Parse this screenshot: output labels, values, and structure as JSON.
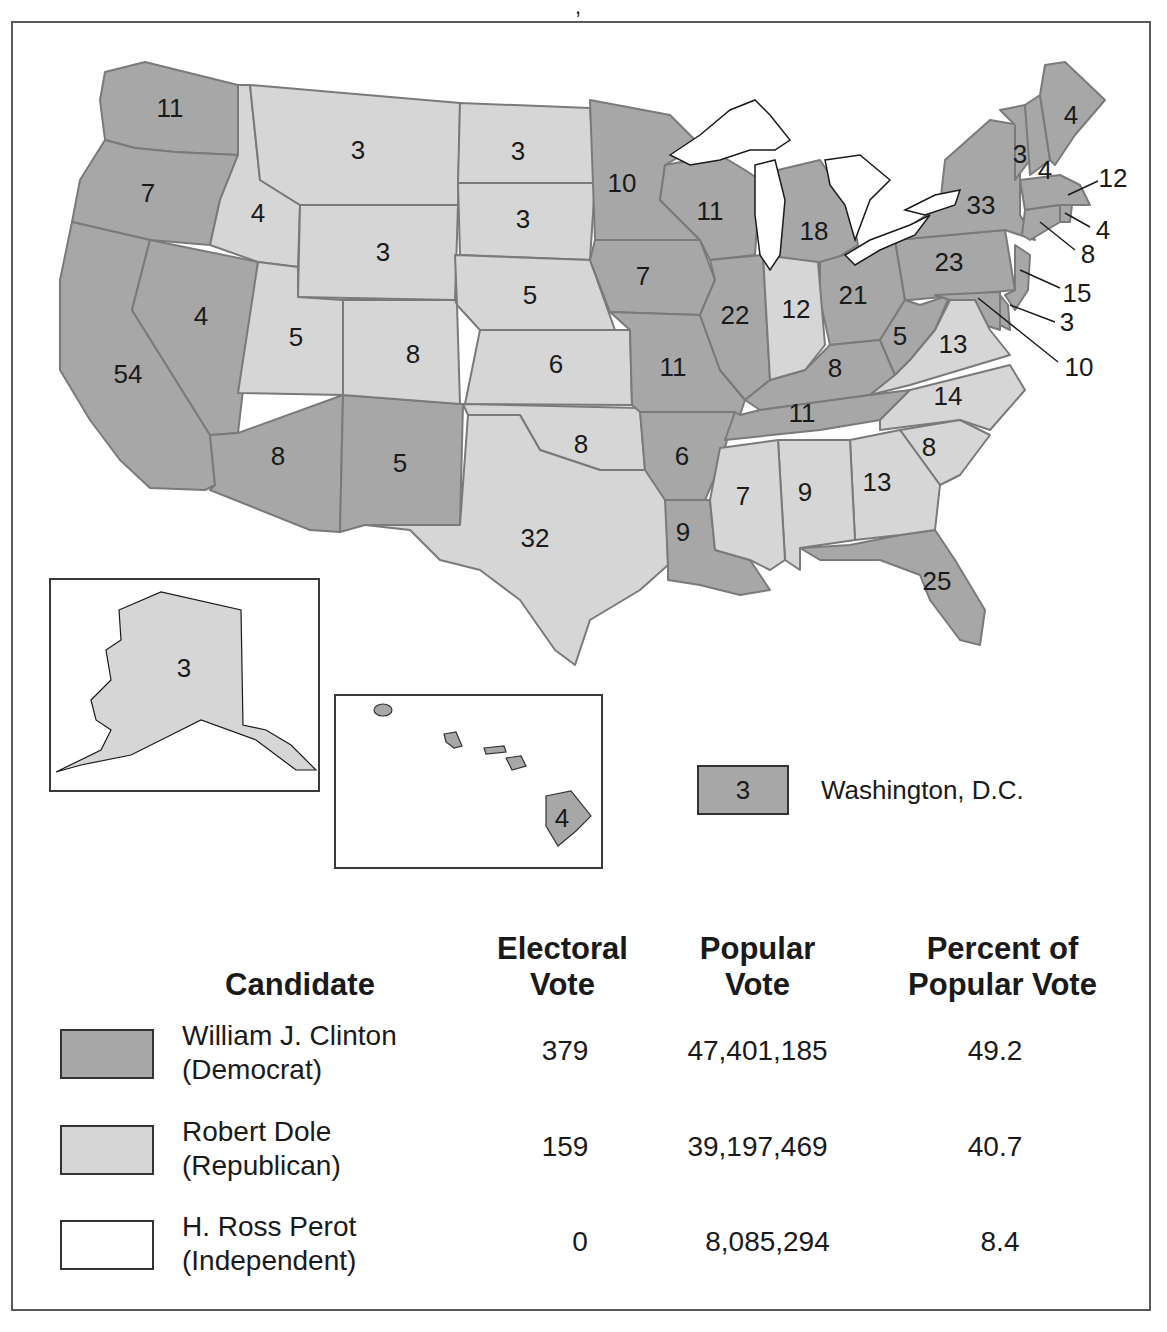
{
  "colors": {
    "democrat": "#a7a7a7",
    "republican": "#d6d6d6",
    "independent": "#ffffff",
    "border": "#7a7a7a",
    "frame": "#5a5a5a"
  },
  "map": {
    "states": [
      {
        "abbr": "WA",
        "votes": "11",
        "party": "democrat"
      },
      {
        "abbr": "OR",
        "votes": "7",
        "party": "democrat"
      },
      {
        "abbr": "CA",
        "votes": "54",
        "party": "democrat"
      },
      {
        "abbr": "NV",
        "votes": "4",
        "party": "democrat"
      },
      {
        "abbr": "ID",
        "votes": "4",
        "party": "republican"
      },
      {
        "abbr": "MT",
        "votes": "3",
        "party": "republican"
      },
      {
        "abbr": "WY",
        "votes": "3",
        "party": "republican"
      },
      {
        "abbr": "UT",
        "votes": "5",
        "party": "republican"
      },
      {
        "abbr": "AZ",
        "votes": "8",
        "party": "democrat"
      },
      {
        "abbr": "CO",
        "votes": "8",
        "party": "republican"
      },
      {
        "abbr": "NM",
        "votes": "5",
        "party": "democrat"
      },
      {
        "abbr": "ND",
        "votes": "3",
        "party": "republican"
      },
      {
        "abbr": "SD",
        "votes": "3",
        "party": "republican"
      },
      {
        "abbr": "NE",
        "votes": "5",
        "party": "republican"
      },
      {
        "abbr": "KS",
        "votes": "6",
        "party": "republican"
      },
      {
        "abbr": "OK",
        "votes": "8",
        "party": "republican"
      },
      {
        "abbr": "TX",
        "votes": "32",
        "party": "republican"
      },
      {
        "abbr": "MN",
        "votes": "10",
        "party": "democrat"
      },
      {
        "abbr": "IA",
        "votes": "7",
        "party": "democrat"
      },
      {
        "abbr": "MO",
        "votes": "11",
        "party": "democrat"
      },
      {
        "abbr": "AR",
        "votes": "6",
        "party": "democrat"
      },
      {
        "abbr": "LA",
        "votes": "9",
        "party": "democrat"
      },
      {
        "abbr": "WI",
        "votes": "11",
        "party": "democrat"
      },
      {
        "abbr": "IL",
        "votes": "22",
        "party": "democrat"
      },
      {
        "abbr": "MI",
        "votes": "18",
        "party": "democrat"
      },
      {
        "abbr": "IN",
        "votes": "12",
        "party": "republican"
      },
      {
        "abbr": "OH",
        "votes": "21",
        "party": "democrat"
      },
      {
        "abbr": "KY",
        "votes": "8",
        "party": "democrat"
      },
      {
        "abbr": "TN",
        "votes": "11",
        "party": "democrat"
      },
      {
        "abbr": "MS",
        "votes": "7",
        "party": "republican"
      },
      {
        "abbr": "AL",
        "votes": "9",
        "party": "republican"
      },
      {
        "abbr": "GA",
        "votes": "13",
        "party": "republican"
      },
      {
        "abbr": "FL",
        "votes": "25",
        "party": "democrat"
      },
      {
        "abbr": "SC",
        "votes": "8",
        "party": "republican"
      },
      {
        "abbr": "NC",
        "votes": "14",
        "party": "republican"
      },
      {
        "abbr": "VA",
        "votes": "13",
        "party": "republican"
      },
      {
        "abbr": "WV",
        "votes": "5",
        "party": "democrat"
      },
      {
        "abbr": "PA",
        "votes": "23",
        "party": "democrat"
      },
      {
        "abbr": "NY",
        "votes": "33",
        "party": "democrat"
      },
      {
        "abbr": "VT",
        "votes": "3",
        "party": "democrat"
      },
      {
        "abbr": "NH",
        "votes": "4",
        "party": "democrat"
      },
      {
        "abbr": "ME",
        "votes": "4",
        "party": "democrat"
      },
      {
        "abbr": "MA",
        "votes": "12",
        "party": "democrat"
      },
      {
        "abbr": "RI",
        "votes": "4",
        "party": "democrat"
      },
      {
        "abbr": "CT",
        "votes": "8",
        "party": "democrat"
      },
      {
        "abbr": "NJ",
        "votes": "15",
        "party": "democrat"
      },
      {
        "abbr": "DE",
        "votes": "3",
        "party": "democrat"
      },
      {
        "abbr": "MD",
        "votes": "10",
        "party": "democrat"
      },
      {
        "abbr": "AK",
        "votes": "3",
        "party": "republican"
      },
      {
        "abbr": "HI",
        "votes": "4",
        "party": "democrat"
      }
    ],
    "dc": {
      "votes": "3",
      "label": "Washington, D.C.",
      "party": "democrat"
    }
  },
  "legend": {
    "headers": {
      "candidate": "Candidate",
      "electoral_1": "Electoral",
      "electoral_2": "Vote",
      "popular_1": "Popular",
      "popular_2": "Vote",
      "percent_1": "Percent of",
      "percent_2": "Popular Vote"
    },
    "rows": [
      {
        "name": "William J. Clinton",
        "party": "(Democrat)",
        "electoral": "379",
        "popular": "47,401,185",
        "percent": "49.2",
        "color": "#a7a7a7"
      },
      {
        "name": "Robert Dole",
        "party": "(Republican)",
        "electoral": "159",
        "popular": "39,197,469",
        "percent": "40.7",
        "color": "#d6d6d6"
      },
      {
        "name": "H. Ross Perot",
        "party": "(Independent)",
        "electoral": "0",
        "popular": "8,085,294",
        "percent": "8.4",
        "color": "#ffffff"
      }
    ]
  }
}
